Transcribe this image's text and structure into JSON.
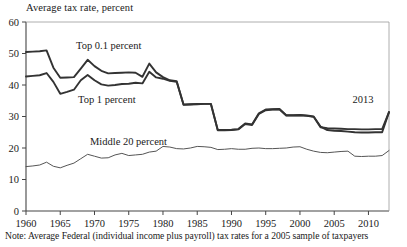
{
  "figure": {
    "axis_title": "Average tax rate, percent",
    "note": "Note: Average Federal (individual income plus payroll) tax rates for a 2005 sample of taxpayers",
    "annotation_2013": "2013"
  },
  "colors": {
    "top01": "#333333",
    "top1": "#333333",
    "middle20": "#555555",
    "axis": "#444444",
    "text": "#1a1a1a"
  },
  "chart_data": {
    "type": "line",
    "title": "Average tax rate, percent",
    "xlabel": "",
    "ylabel": "Average tax rate, percent",
    "xlim": [
      1960,
      2013
    ],
    "ylim": [
      0,
      60
    ],
    "yticks": [
      0,
      10,
      20,
      30,
      40,
      50,
      60
    ],
    "xticks": [
      1960,
      1965,
      1970,
      1975,
      1980,
      1985,
      1990,
      1995,
      2000,
      2005,
      2010
    ],
    "grid": false,
    "legend": "inline-labels",
    "annotations": [
      {
        "text": "2013",
        "x": 2011,
        "y": 34.5
      }
    ],
    "x": [
      1960,
      1961,
      1962,
      1963,
      1964,
      1965,
      1966,
      1967,
      1968,
      1969,
      1970,
      1971,
      1972,
      1973,
      1974,
      1975,
      1976,
      1977,
      1978,
      1979,
      1980,
      1981,
      1982,
      1983,
      1984,
      1985,
      1986,
      1987,
      1988,
      1989,
      1990,
      1991,
      1992,
      1993,
      1994,
      1995,
      1996,
      1997,
      1998,
      1999,
      2000,
      2001,
      2002,
      2003,
      2004,
      2005,
      2006,
      2007,
      2008,
      2009,
      2010,
      2011,
      2012,
      2013
    ],
    "series": [
      {
        "name": "Top 0.1 percent",
        "label": "Top 0.1 percent",
        "values": [
          50.5,
          50.6,
          50.7,
          51.0,
          45.5,
          42.3,
          42.4,
          42.5,
          45.2,
          48.0,
          46.0,
          44.5,
          43.7,
          43.8,
          43.9,
          44.0,
          43.9,
          42.6,
          46.8,
          44.0,
          42.5,
          41.5,
          41.2,
          33.8,
          33.9,
          34.0,
          34.0,
          34.0,
          25.7,
          25.7,
          25.8,
          26.0,
          27.8,
          27.5,
          31.0,
          32.2,
          32.3,
          32.4,
          30.4,
          30.4,
          30.5,
          30.3,
          30.0,
          26.8,
          25.7,
          25.5,
          25.4,
          25.2,
          25.0,
          24.9,
          24.9,
          25.0,
          25.0,
          31.4
        ]
      },
      {
        "name": "Top 1 percent",
        "label": "Top 1 percent",
        "values": [
          42.7,
          42.9,
          43.1,
          43.8,
          41.0,
          37.2,
          37.8,
          38.5,
          41.5,
          43.2,
          41.5,
          40.2,
          39.8,
          40.0,
          40.3,
          40.4,
          40.7,
          40.5,
          44.2,
          42.4,
          42.0,
          41.3,
          41.0,
          33.7,
          33.8,
          33.9,
          34.0,
          34.0,
          25.6,
          25.6,
          25.7,
          25.9,
          27.6,
          27.3,
          30.8,
          32.0,
          32.2,
          32.3,
          30.3,
          30.3,
          30.4,
          30.2,
          29.9,
          26.6,
          26.3,
          26.2,
          26.1,
          26.0,
          26.0,
          25.9,
          25.9,
          26.0,
          26.0,
          31.4
        ]
      },
      {
        "name": "Middle 20 percent",
        "label": "Middle 20 percent",
        "values": [
          14.1,
          14.3,
          14.6,
          15.5,
          14.2,
          13.7,
          14.5,
          15.2,
          16.6,
          18.0,
          17.4,
          16.8,
          16.9,
          17.8,
          18.3,
          17.6,
          17.8,
          18.0,
          18.7,
          19.0,
          20.5,
          20.3,
          19.8,
          19.7,
          20.0,
          20.5,
          20.4,
          20.2,
          19.5,
          19.6,
          19.8,
          19.6,
          19.6,
          19.9,
          20.0,
          19.8,
          19.8,
          19.9,
          20.0,
          20.3,
          20.4,
          19.6,
          19.0,
          18.6,
          18.5,
          18.7,
          18.9,
          19.0,
          17.4,
          17.3,
          17.4,
          17.4,
          17.6,
          19.2
        ]
      }
    ]
  }
}
